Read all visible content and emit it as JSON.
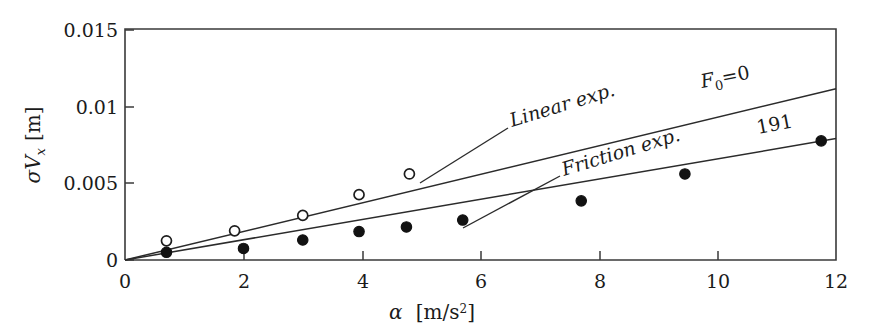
{
  "figure": {
    "name": "sigma-Vx-versus-alpha-plot",
    "background_color": "#ffffff",
    "line_color": "#2b2b2b"
  },
  "axes": {
    "x": {
      "label_symbol": "α",
      "label_units": "[m/s²]",
      "label_full": "α [m/s²]",
      "ticks": [
        "0",
        "2",
        "4",
        "6",
        "8",
        "10",
        "12"
      ],
      "tick_values": [
        0,
        2,
        4,
        6,
        8,
        10,
        12
      ],
      "min": 0,
      "max": 12
    },
    "y": {
      "label_symbol": "σV",
      "label_subscript": "x",
      "label_units": "[m]",
      "label_full": "σVx [m]",
      "ticks": [
        "0",
        "0.005",
        "0.01",
        "0.015"
      ],
      "tick_values": [
        0,
        0.005,
        0.01,
        0.015
      ],
      "min": 0,
      "max": 0.015
    }
  },
  "annotations": {
    "linear_exp": "Linear exp.",
    "friction_exp": "Friction exp.",
    "f0_label_base": "F",
    "f0_label_sub": "0",
    "f0_label_rest": "=0",
    "f0_label_full": "F₀=0",
    "series_191": "191"
  },
  "chart_data": {
    "type": "scatter",
    "title": "",
    "xlabel": "α [m/s²]",
    "ylabel": "σVx [m]",
    "xlim": [
      0,
      12
    ],
    "ylim": [
      0,
      0.015
    ],
    "grid": false,
    "legend": "inline annotations",
    "series": [
      {
        "name": "Linear exp.",
        "marker": "open-circle",
        "annotation": "F₀=0",
        "fit_line": {
          "x": [
            0,
            12
          ],
          "y": [
            0,
            0.01115
          ],
          "slope": 0.000929,
          "intercept": 0
        },
        "points": [
          {
            "x": 0.7,
            "y": 0.00125
          },
          {
            "x": 1.85,
            "y": 0.0019
          },
          {
            "x": 3.0,
            "y": 0.0029
          },
          {
            "x": 3.95,
            "y": 0.00425
          },
          {
            "x": 4.8,
            "y": 0.0056
          }
        ]
      },
      {
        "name": "Friction exp.",
        "marker": "filled-circle",
        "annotation": "191",
        "fit_line": {
          "x": [
            0,
            12
          ],
          "y": [
            0,
            0.0079
          ],
          "slope": 0.000658,
          "intercept": 0
        },
        "points": [
          {
            "x": 0.7,
            "y": 0.0005
          },
          {
            "x": 2.0,
            "y": 0.00075
          },
          {
            "x": 3.0,
            "y": 0.0013
          },
          {
            "x": 3.95,
            "y": 0.00185
          },
          {
            "x": 4.75,
            "y": 0.00215
          },
          {
            "x": 5.7,
            "y": 0.0026
          },
          {
            "x": 7.7,
            "y": 0.00385
          },
          {
            "x": 9.45,
            "y": 0.0056
          },
          {
            "x": 11.75,
            "y": 0.00775
          }
        ]
      }
    ]
  }
}
